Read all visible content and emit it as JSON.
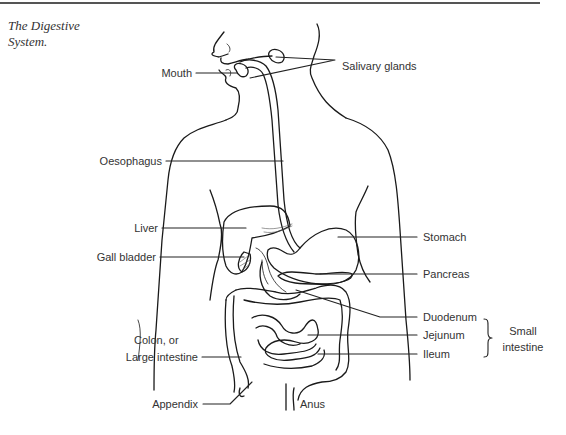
{
  "figure": {
    "caption": "The Digestive System.",
    "caption_lines": [
      "The Digestive",
      "System."
    ]
  },
  "labels": {
    "mouth": "Mouth",
    "salivary_glands": "Salivary glands",
    "oesophagus": "Oesophagus",
    "liver": "Liver",
    "gall_bladder": "Gall bladder",
    "stomach": "Stomach",
    "pancreas": "Pancreas",
    "duodenum": "Duodenum",
    "jejunum": "Jejunum",
    "ileum": "Ileum",
    "small_intestine_line1": "Small",
    "small_intestine_line2": "intestine",
    "colon_line1": "Colon, or",
    "colon_line2": "Large intestine",
    "appendix": "Appendix",
    "anus": "Anus"
  },
  "colors": {
    "line": "#1a1a1a",
    "text": "#333333",
    "background": "#ffffff"
  }
}
